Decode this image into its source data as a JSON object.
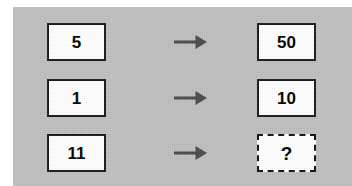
{
  "panel": {
    "background_color": "#bfbfbf",
    "page_background_color": "#ffffff"
  },
  "colors": {
    "box_fill": "#ffffff",
    "box_border": "#1a1a1a",
    "unknown_box_border": "#111111",
    "text": "#000000",
    "arrow": "#4a4a4a"
  },
  "puzzle": {
    "type": "number-mapping",
    "rows": [
      {
        "input": "5",
        "arrow_icon": "arrow-right-icon",
        "output": "50",
        "output_is_unknown": false
      },
      {
        "input": "1",
        "arrow_icon": "arrow-right-icon",
        "output": "10",
        "output_is_unknown": false
      },
      {
        "input": "11",
        "arrow_icon": "arrow-right-icon",
        "output": "?",
        "output_is_unknown": true
      }
    ]
  }
}
